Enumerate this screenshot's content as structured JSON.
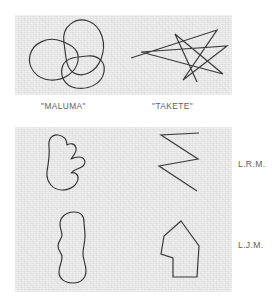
{
  "figure": {
    "ink_color": "#333333",
    "panel_color": "#ececec",
    "text_color": "#5e5e5e"
  },
  "captions": {
    "maluma": "\"MALUMA\"",
    "takete": "\"TAKETE\""
  },
  "subjects": {
    "first": "L.R.M.",
    "second": "L.J.M."
  },
  "panels": [
    {
      "name": "reference-panel",
      "drawings": [
        {
          "name": "maluma-reference-drawing",
          "style": "rounded",
          "description": "three overlapping rounded loops"
        },
        {
          "name": "takete-reference-drawing",
          "style": "angular",
          "description": "jagged star-like polyline"
        }
      ]
    },
    {
      "name": "subject-drawings-panel",
      "rows": [
        {
          "subject": "L.R.M.",
          "drawings": [
            {
              "name": "maluma-drawing-lrm",
              "style": "rounded",
              "description": "bumpy lobed blob"
            },
            {
              "name": "takete-drawing-lrm",
              "style": "angular",
              "description": "Z-shaped zigzag"
            }
          ]
        },
        {
          "subject": "L.J.M.",
          "drawings": [
            {
              "name": "maluma-drawing-ljm",
              "style": "rounded",
              "description": "tall wavy vertical blob"
            },
            {
              "name": "takete-drawing-ljm",
              "style": "angular",
              "description": "angular house-like polygon"
            }
          ]
        }
      ]
    }
  ]
}
